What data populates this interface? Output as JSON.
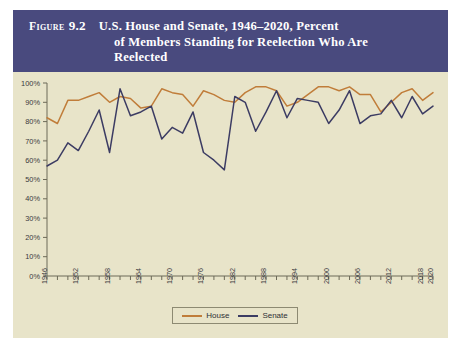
{
  "figure": {
    "label": "Figure",
    "number": "9.2",
    "title_lines": [
      "U.S. House and Senate, 1946–2020, Percent",
      "of Members Standing for Reelection Who Are",
      "Reelected"
    ],
    "header_bg": "#494a7e",
    "panel_bg": "#e8e4c9"
  },
  "legend": {
    "position": "bottom-center",
    "items": [
      {
        "label": "House",
        "color": "#c07d3a"
      },
      {
        "label": "Senate",
        "color": "#3c3c63"
      }
    ]
  },
  "chart_data": {
    "type": "line",
    "title": "U.S. House and Senate, 1946–2020, Percent of Members Standing for Reelection Who Are Reelected",
    "xlabel": "",
    "ylabel": "",
    "grid": false,
    "legend_position": "bottom",
    "xlim": [
      1946,
      2020
    ],
    "ylim": [
      0,
      100
    ],
    "ytick_labels": [
      "0%",
      "10%",
      "20%",
      "30%",
      "40%",
      "50%",
      "60%",
      "70%",
      "80%",
      "90%",
      "100%"
    ],
    "ytick_values": [
      0,
      10,
      20,
      30,
      40,
      50,
      60,
      70,
      80,
      90,
      100
    ],
    "xtick_labels": [
      "1946",
      "1952",
      "1958",
      "1964",
      "1970",
      "1976",
      "1982",
      "1988",
      "1994",
      "2000",
      "2006",
      "2012",
      "2018",
      "2020"
    ],
    "xtick_values": [
      1946,
      1952,
      1958,
      1964,
      1970,
      1976,
      1982,
      1988,
      1994,
      2000,
      2006,
      2012,
      2018,
      2020
    ],
    "x": [
      1946,
      1948,
      1950,
      1952,
      1954,
      1956,
      1958,
      1960,
      1962,
      1964,
      1966,
      1968,
      1970,
      1972,
      1974,
      1976,
      1978,
      1980,
      1982,
      1984,
      1986,
      1988,
      1990,
      1992,
      1994,
      1996,
      1998,
      2000,
      2002,
      2004,
      2006,
      2008,
      2010,
      2012,
      2014,
      2016,
      2018,
      2020
    ],
    "series": [
      {
        "name": "House",
        "color": "#c07d3a",
        "values": [
          82,
          79,
          91,
          91,
          93,
          95,
          90,
          93,
          92,
          87,
          88,
          97,
          95,
          94,
          88,
          96,
          94,
          91,
          90,
          95,
          98,
          98,
          96,
          88,
          90,
          94,
          98,
          98,
          96,
          98,
          94,
          94,
          85,
          90,
          95,
          97,
          91,
          95
        ]
      },
      {
        "name": "Senate",
        "color": "#3c3c63",
        "values": [
          57,
          60,
          69,
          65,
          75,
          86,
          64,
          97,
          83,
          85,
          88,
          71,
          77,
          74,
          85,
          64,
          60,
          55,
          93,
          90,
          75,
          85,
          96,
          82,
          92,
          91,
          90,
          79,
          86,
          96,
          79,
          83,
          84,
          91,
          82,
          93,
          84,
          88
        ]
      }
    ]
  }
}
